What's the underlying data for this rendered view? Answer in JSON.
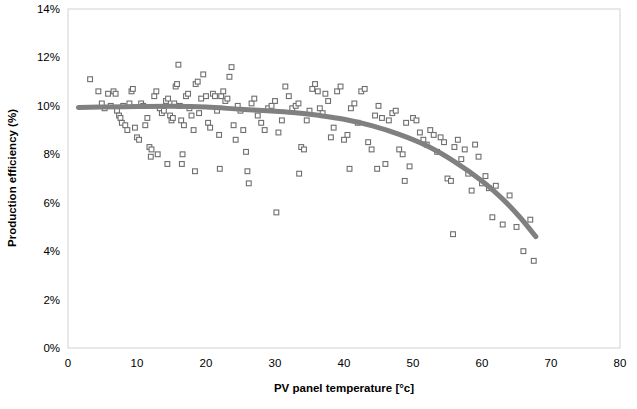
{
  "chart_data": {
    "type": "scatter",
    "title": "",
    "subtitle": "",
    "xlabel": "PV panel temperature [°c]",
    "ylabel": "Production efficiency (%)",
    "xlim": [
      0,
      80
    ],
    "ylim": [
      0,
      14
    ],
    "xticks": [
      0,
      10,
      20,
      30,
      40,
      50,
      60,
      70,
      80
    ],
    "yticks": [
      0,
      2,
      4,
      6,
      8,
      10,
      12,
      14
    ],
    "xticklabels": [
      "0",
      "10",
      "20",
      "30",
      "40",
      "50",
      "60",
      "70",
      "80"
    ],
    "yticklabels": [
      "0%",
      "2%",
      "4%",
      "6%",
      "8%",
      "10%",
      "12%",
      "14%"
    ],
    "grid": false,
    "legend": false,
    "legend_position": "none",
    "marker": "open-square",
    "marker_color": "#6e6e6e",
    "marker_fill": "#ffffff",
    "plot_border_color": "#d9d9d9",
    "series": [
      {
        "name": "Measured efficiency",
        "type": "scatter",
        "points": [
          [
            3.2,
            11.1
          ],
          [
            4.4,
            10.6
          ],
          [
            4.9,
            10.1
          ],
          [
            5.3,
            9.9
          ],
          [
            5.8,
            10.5
          ],
          [
            6.2,
            10.0
          ],
          [
            6.6,
            10.6
          ],
          [
            6.9,
            10.5
          ],
          [
            7.1,
            9.8
          ],
          [
            7.4,
            9.6
          ],
          [
            7.6,
            9.5
          ],
          [
            7.8,
            9.3
          ],
          [
            8.0,
            10.0
          ],
          [
            8.3,
            9.2
          ],
          [
            8.6,
            9.0
          ],
          [
            8.9,
            10.1
          ],
          [
            9.2,
            10.6
          ],
          [
            9.4,
            10.7
          ],
          [
            9.7,
            9.1
          ],
          [
            10.0,
            8.7
          ],
          [
            10.3,
            8.6
          ],
          [
            10.6,
            10.1
          ],
          [
            10.9,
            10.0
          ],
          [
            11.2,
            9.2
          ],
          [
            11.5,
            9.5
          ],
          [
            11.8,
            8.3
          ],
          [
            12.1,
            8.2
          ],
          [
            12.5,
            10.4
          ],
          [
            12.8,
            10.6
          ],
          [
            13.0,
            8.0
          ],
          [
            13.3,
            9.9
          ],
          [
            13.6,
            9.7
          ],
          [
            13.9,
            9.8
          ],
          [
            14.2,
            10.2
          ],
          [
            14.5,
            10.3
          ],
          [
            14.8,
            9.6
          ],
          [
            15.0,
            9.4
          ],
          [
            15.2,
            9.5
          ],
          [
            15.4,
            10.1
          ],
          [
            15.6,
            10.8
          ],
          [
            15.8,
            10.9
          ],
          [
            16.0,
            11.7
          ],
          [
            16.2,
            10.0
          ],
          [
            16.4,
            9.4
          ],
          [
            16.6,
            8.0
          ],
          [
            16.8,
            9.2
          ],
          [
            17.1,
            10.4
          ],
          [
            17.4,
            10.5
          ],
          [
            17.6,
            9.9
          ],
          [
            17.9,
            9.6
          ],
          [
            18.2,
            9.0
          ],
          [
            18.5,
            10.9
          ],
          [
            18.8,
            11.0
          ],
          [
            19.0,
            9.7
          ],
          [
            19.3,
            10.3
          ],
          [
            19.6,
            11.3
          ],
          [
            20.0,
            10.4
          ],
          [
            20.3,
            9.3
          ],
          [
            20.6,
            9.1
          ],
          [
            21.0,
            10.5
          ],
          [
            21.3,
            10.4
          ],
          [
            21.6,
            9.8
          ],
          [
            21.9,
            8.8
          ],
          [
            22.2,
            10.4
          ],
          [
            22.5,
            10.6
          ],
          [
            22.8,
            10.2
          ],
          [
            23.1,
            10.3
          ],
          [
            23.4,
            11.2
          ],
          [
            23.7,
            11.6
          ],
          [
            24.0,
            9.2
          ],
          [
            24.3,
            8.6
          ],
          [
            24.6,
            10.0
          ],
          [
            25.0,
            9.8
          ],
          [
            25.4,
            9.0
          ],
          [
            25.8,
            8.1
          ],
          [
            26.2,
            6.8
          ],
          [
            26.6,
            10.1
          ],
          [
            27.0,
            10.3
          ],
          [
            27.5,
            9.6
          ],
          [
            28.0,
            9.3
          ],
          [
            28.5,
            9.0
          ],
          [
            29.0,
            9.9
          ],
          [
            29.5,
            10.0
          ],
          [
            30.0,
            10.2
          ],
          [
            30.5,
            8.9
          ],
          [
            31.0,
            9.4
          ],
          [
            31.5,
            10.8
          ],
          [
            32.0,
            10.4
          ],
          [
            32.5,
            9.9
          ],
          [
            33.0,
            10.0
          ],
          [
            33.4,
            10.1
          ],
          [
            33.8,
            8.3
          ],
          [
            34.2,
            8.2
          ],
          [
            34.6,
            9.4
          ],
          [
            35.0,
            9.8
          ],
          [
            35.4,
            10.7
          ],
          [
            35.8,
            10.9
          ],
          [
            36.2,
            10.6
          ],
          [
            36.5,
            9.9
          ],
          [
            36.9,
            9.7
          ],
          [
            37.3,
            10.5
          ],
          [
            37.7,
            10.2
          ],
          [
            38.1,
            8.7
          ],
          [
            38.5,
            9.1
          ],
          [
            39.0,
            10.6
          ],
          [
            39.5,
            10.8
          ],
          [
            40.0,
            8.6
          ],
          [
            40.5,
            8.8
          ],
          [
            41.0,
            9.9
          ],
          [
            41.5,
            10.1
          ],
          [
            42.0,
            9.3
          ],
          [
            42.5,
            10.6
          ],
          [
            43.0,
            10.7
          ],
          [
            43.5,
            8.5
          ],
          [
            44.0,
            8.2
          ],
          [
            44.5,
            9.6
          ],
          [
            45.0,
            10.0
          ],
          [
            45.5,
            9.5
          ],
          [
            46.0,
            7.6
          ],
          [
            46.5,
            9.4
          ],
          [
            47.0,
            9.7
          ],
          [
            47.5,
            9.8
          ],
          [
            48.0,
            8.2
          ],
          [
            48.5,
            8.0
          ],
          [
            49.0,
            9.3
          ],
          [
            49.5,
            7.5
          ],
          [
            50.0,
            9.5
          ],
          [
            50.5,
            9.4
          ],
          [
            51.0,
            8.9
          ],
          [
            51.5,
            8.6
          ],
          [
            52.0,
            8.4
          ],
          [
            52.5,
            9.0
          ],
          [
            53.0,
            8.8
          ],
          [
            53.5,
            8.1
          ],
          [
            54.0,
            8.7
          ],
          [
            54.5,
            8.5
          ],
          [
            55.0,
            7.0
          ],
          [
            55.5,
            6.9
          ],
          [
            56.0,
            8.3
          ],
          [
            56.5,
            8.6
          ],
          [
            57.0,
            7.8
          ],
          [
            57.5,
            8.2
          ],
          [
            58.0,
            7.2
          ],
          [
            58.5,
            6.5
          ],
          [
            59.0,
            8.4
          ],
          [
            59.5,
            7.9
          ],
          [
            60.0,
            6.8
          ],
          [
            60.5,
            7.1
          ],
          [
            61.0,
            6.6
          ],
          [
            61.5,
            5.4
          ],
          [
            62.0,
            6.7
          ],
          [
            63.0,
            5.1
          ],
          [
            64.0,
            6.3
          ],
          [
            65.0,
            5.0
          ],
          [
            66.0,
            4.0
          ],
          [
            67.0,
            5.3
          ],
          [
            67.5,
            3.6
          ],
          [
            30.2,
            5.6
          ],
          [
            33.5,
            7.2
          ],
          [
            26.0,
            7.3
          ],
          [
            22.0,
            7.4
          ],
          [
            18.4,
            7.3
          ],
          [
            14.4,
            7.6
          ],
          [
            16.5,
            7.6
          ],
          [
            12.0,
            7.9
          ],
          [
            44.8,
            7.4
          ],
          [
            40.8,
            7.4
          ],
          [
            48.8,
            6.9
          ],
          [
            55.8,
            4.7
          ]
        ]
      },
      {
        "name": "Fitted trend",
        "type": "line",
        "color": "#808080",
        "width": 5,
        "points": [
          [
            1.5,
            9.93
          ],
          [
            5.0,
            9.95
          ],
          [
            10.0,
            9.97
          ],
          [
            15.0,
            9.98
          ],
          [
            20.0,
            9.95
          ],
          [
            25.0,
            9.86
          ],
          [
            30.0,
            9.78
          ],
          [
            33.0,
            9.72
          ],
          [
            36.0,
            9.62
          ],
          [
            40.0,
            9.45
          ],
          [
            44.0,
            9.18
          ],
          [
            48.0,
            8.82
          ],
          [
            52.0,
            8.35
          ],
          [
            56.0,
            7.7
          ],
          [
            60.0,
            6.9
          ],
          [
            63.0,
            6.15
          ],
          [
            65.5,
            5.4
          ],
          [
            67.8,
            4.6
          ]
        ]
      }
    ],
    "annotations": []
  },
  "axes": {
    "x_title": "PV panel temperature [°c]",
    "y_title": "Production efficiency (%)"
  }
}
